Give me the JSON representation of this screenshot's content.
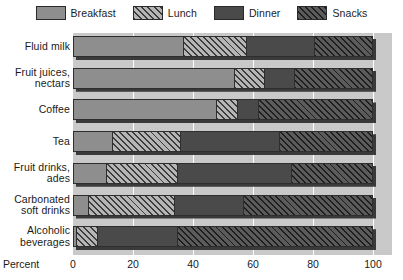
{
  "legend": {
    "items": [
      {
        "label": "Breakfast",
        "key": "breakfast",
        "color": "#8e8e8e",
        "pattern": "solid"
      },
      {
        "label": "Lunch",
        "key": "lunch",
        "color": "#b5b5b5",
        "pattern": "diagonal-hatch-light"
      },
      {
        "label": "Dinner",
        "key": "dinner",
        "color": "#4a4a4a",
        "pattern": "solid"
      },
      {
        "label": "Snacks",
        "key": "snacks",
        "color": "#5b5b5b",
        "pattern": "diagonal-hatch-dark"
      }
    ]
  },
  "axis": {
    "x_label": "Percent",
    "x_ticks": [
      "0",
      "20",
      "40",
      "60",
      "80",
      "100"
    ]
  },
  "chart_data": {
    "type": "bar",
    "orientation": "horizontal",
    "stacked": true,
    "title": "",
    "xlabel": "Percent",
    "ylabel": "",
    "xlim": [
      0,
      100
    ],
    "grid": true,
    "legend_position": "top",
    "categories": [
      "Fluid milk",
      "Fruit juices, nectars",
      "Coffee",
      "Tea",
      "Fruit drinks, ades",
      "Carbonated soft drinks",
      "Alcoholic beverages"
    ],
    "category_lines": [
      [
        "Fluid milk"
      ],
      [
        "Fruit juices,",
        "nectars"
      ],
      [
        "Coffee"
      ],
      [
        "Tea"
      ],
      [
        "Fruit drinks,",
        "ades"
      ],
      [
        "Carbonated",
        "soft drinks"
      ],
      [
        "Alcoholic",
        "beverages"
      ]
    ],
    "series": [
      {
        "name": "Breakfast",
        "key": "breakfast",
        "values": [
          37,
          54,
          48,
          13,
          11,
          5,
          1
        ]
      },
      {
        "name": "Lunch",
        "key": "lunch",
        "values": [
          21,
          10,
          7,
          23,
          24,
          29,
          7
        ]
      },
      {
        "name": "Dinner",
        "key": "dinner",
        "values": [
          23,
          10,
          7,
          33,
          38,
          23,
          27
        ]
      },
      {
        "name": "Snacks",
        "key": "snacks",
        "values": [
          19,
          26,
          38,
          31,
          27,
          43,
          65
        ]
      }
    ]
  }
}
